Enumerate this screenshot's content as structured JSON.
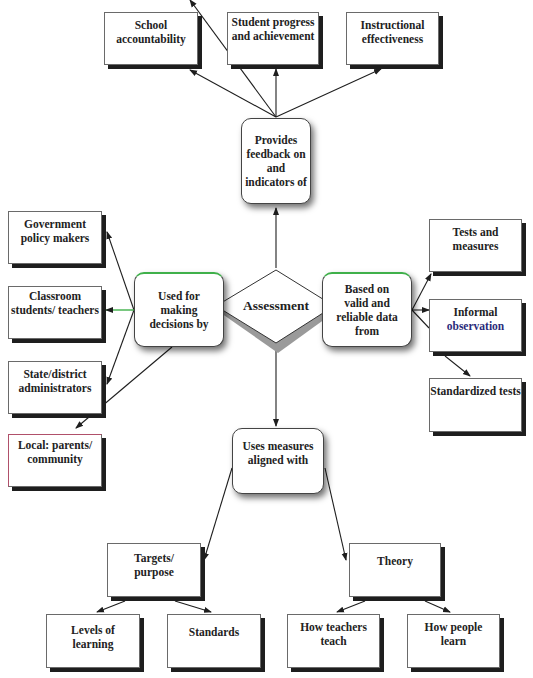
{
  "center": {
    "label": "Assessment"
  },
  "hubs": {
    "feedback": "Provides feedback on and indicators of",
    "decisions": "Used for making decisions by",
    "data": "Based on valid and reliable data from",
    "measures": "Uses measures aligned with"
  },
  "feedback_targets": [
    {
      "label": "School accountability"
    },
    {
      "label": "Student progress and achievement"
    },
    {
      "label": "Instructional effectiveness"
    }
  ],
  "decision_makers": [
    {
      "label": "Government policy makers"
    },
    {
      "label": "Classroom students/ teachers"
    },
    {
      "label": "State/district administrators"
    },
    {
      "label": "Local: parents/ community"
    }
  ],
  "data_sources": [
    {
      "label": "Tests and measures"
    },
    {
      "label_part1": "Informal",
      "label_part2": "observation"
    },
    {
      "label": "Standardized tests"
    }
  ],
  "alignment": {
    "targets": {
      "label": "Targets/ purpose",
      "children": [
        "Levels of learning",
        "Standards"
      ]
    },
    "theory": {
      "label": "Theory",
      "children": [
        "How teachers teach",
        "How people learn"
      ]
    }
  },
  "colors": {
    "line": "#1e1e1e",
    "accent_green": "#3fb04a",
    "accent_blue": "#2a2a7a",
    "shadow": "#1e1e1e"
  }
}
